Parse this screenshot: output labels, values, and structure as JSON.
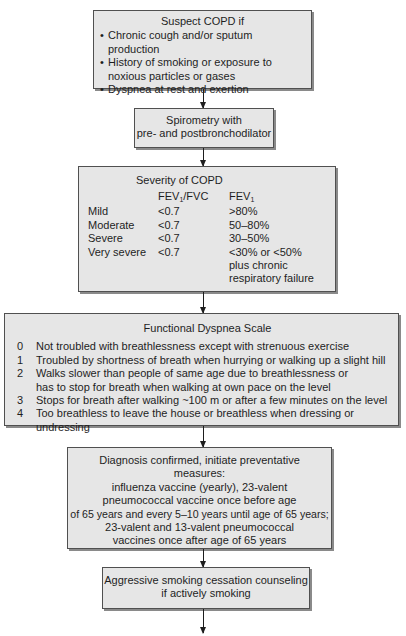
{
  "suspect": {
    "title": "Suspect COPD if",
    "bullets": [
      "Chronic cough and/or sputum production",
      "History of smoking or exposure to noxious particles or gases",
      "Dyspnea at rest and exertion"
    ]
  },
  "spirometry": {
    "lines": [
      "Spirometry with",
      "pre- and postbronchodilator"
    ]
  },
  "severity": {
    "title": "Severity of COPD",
    "header_ratio": "FEV",
    "header_ratio_sub": "1",
    "header_ratio_suffix": "/FVC",
    "header_fev": "FEV",
    "header_fev_sub": "1",
    "rows": [
      {
        "grade": "Mild",
        "ratio": "<0.7",
        "fev1": ">80%"
      },
      {
        "grade": "Moderate",
        "ratio": "<0.7",
        "fev1": "50–80%"
      },
      {
        "grade": "Severe",
        "ratio": "<0.7",
        "fev1": "30–50%"
      },
      {
        "grade": "Very severe",
        "ratio": "<0.7",
        "fev1_lines": [
          "<30% or <50%",
          "plus chronic",
          "respiratory failure"
        ]
      }
    ]
  },
  "dyspnea": {
    "title": "Functional Dyspnea Scale",
    "items": [
      {
        "num": "0",
        "lines": [
          "Not troubled with breathlessness except with strenuous exercise"
        ]
      },
      {
        "num": "1",
        "lines": [
          "Troubled by shortness of breath when hurrying or walking up a slight hill"
        ]
      },
      {
        "num": "2",
        "lines": [
          "Walks slower than people of same age due to breathlessness or",
          "has to stop for breath when walking at own pace on the level"
        ]
      },
      {
        "num": "3",
        "lines": [
          "Stops for breath after walking ~100 m or after a few minutes on the level"
        ]
      },
      {
        "num": "4",
        "lines": [
          "Too breathless to leave the house or breathless when dressing or undressing"
        ]
      }
    ]
  },
  "diagnosis": {
    "lines": [
      "Diagnosis confirmed, initiate preventative",
      "measures:",
      "influenza vaccine (yearly), 23-valent",
      "pneumococcal vaccine once before age",
      "of 65 years and every 5–10 years until age of 65 years;",
      "23-valent and 13-valent pneumococcal",
      "vaccines once after age of 65 years"
    ]
  },
  "smoking": {
    "lines": [
      "Aggressive smoking cessation counseling",
      "if actively smoking"
    ]
  },
  "colors": {
    "box_fill": "#e6e6e6",
    "box_border": "#505050",
    "box_shadow": "#8a8a8a",
    "text": "#1e1e1e",
    "background": "#ffffff"
  }
}
